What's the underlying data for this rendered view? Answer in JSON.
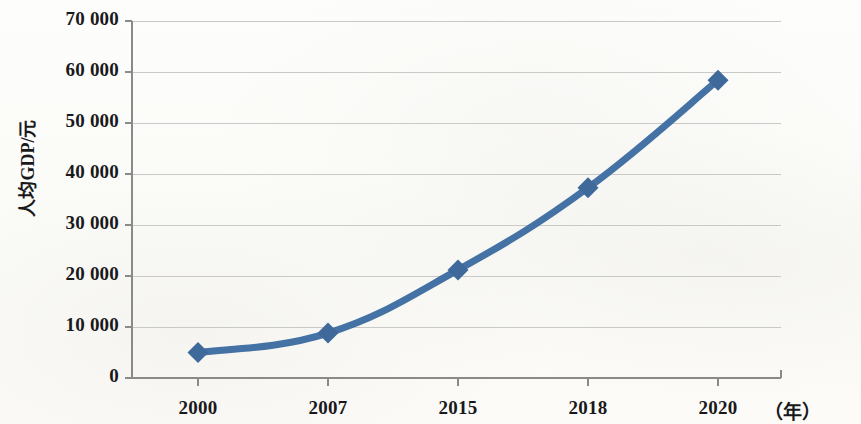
{
  "chart_data": {
    "type": "line",
    "title": "",
    "subtitle": "",
    "xlabel": "（年）",
    "ylabel": "人均GDP/元",
    "categories": [
      "2000",
      "2007",
      "2015",
      "2018",
      "2020"
    ],
    "values": [
      5000,
      8800,
      21200,
      37300,
      58400
    ],
    "series": [
      {
        "name": "人均GDP",
        "values": [
          5000,
          8800,
          21200,
          37300,
          58400
        ]
      }
    ],
    "ylim": [
      0,
      70000
    ],
    "y_ticks": [
      0,
      10000,
      20000,
      30000,
      40000,
      50000,
      60000,
      70000
    ],
    "y_tick_labels": [
      "0",
      "10 000",
      "20 000",
      "30 000",
      "40 000",
      "50 000",
      "60 000",
      "70 000"
    ],
    "x_tick_labels": [
      "2000",
      "2007",
      "2015",
      "2018",
      "2020"
    ],
    "grid": true,
    "grid_axis": "y",
    "legend": false,
    "legend_position": "none",
    "marker": "diamond",
    "colors": {
      "line": "#4472A4",
      "marker": "#40699B",
      "grid": "#c9c9c7",
      "axis": "#8a8a88",
      "text": "#19191b",
      "background": "#fcfcfa"
    }
  }
}
